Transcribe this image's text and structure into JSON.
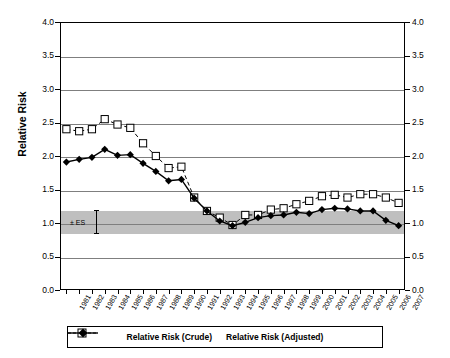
{
  "chart_data": {
    "type": "line",
    "title": "",
    "xlabel": "",
    "ylabel": "Relative Risk",
    "ylim": [
      0.0,
      4.0
    ],
    "ytick_labels": [
      "0.0",
      "0.5",
      "1.0",
      "1.5",
      "2.0",
      "2.5",
      "3.0",
      "3.5",
      "4.0"
    ],
    "ytick_values": [
      0.0,
      0.5,
      1.0,
      1.5,
      2.0,
      2.5,
      3.0,
      3.5,
      4.0
    ],
    "dual_axis": true,
    "right_ytick_labels": [
      "0.0",
      "0.5",
      "1.0",
      "1.5",
      "2.0",
      "2.5",
      "3.0",
      "3.5",
      "4.0"
    ],
    "grid": true,
    "legend_position": "bottom",
    "categories": [
      "1981",
      "1982",
      "1983",
      "1984",
      "1985",
      "1986",
      "1987",
      "1988",
      "1989",
      "1990",
      "1991",
      "1992",
      "1993",
      "1994",
      "1995",
      "1996",
      "1997",
      "1998",
      "1999",
      "2000",
      "2001",
      "2002",
      "2003",
      "2004",
      "2005",
      "2006",
      "2007"
    ],
    "series": [
      {
        "name": "Relative Risk (Crude)",
        "marker": "open-square",
        "line": "dashed",
        "color": "#000000",
        "values": [
          2.4,
          2.37,
          2.4,
          2.55,
          2.47,
          2.42,
          2.19,
          2.0,
          1.82,
          1.84,
          1.38,
          1.18,
          1.08,
          0.97,
          1.12,
          1.12,
          1.2,
          1.22,
          1.28,
          1.33,
          1.4,
          1.42,
          1.38,
          1.43,
          1.43,
          1.38,
          1.3
        ]
      },
      {
        "name": "Relative Risk (Adjusted)",
        "marker": "filled-diamond",
        "line": "solid",
        "color": "#000000",
        "values": [
          1.91,
          1.95,
          1.98,
          2.1,
          2.01,
          2.02,
          1.89,
          1.77,
          1.63,
          1.65,
          1.37,
          1.18,
          1.03,
          0.96,
          1.01,
          1.08,
          1.11,
          1.12,
          1.16,
          1.14,
          1.2,
          1.22,
          1.21,
          1.18,
          1.18,
          1.04,
          0.96
        ]
      }
    ],
    "band": {
      "label": "± ES",
      "lower": 0.85,
      "upper": 1.2,
      "color": "#bfbfbf"
    }
  },
  "legend": {
    "items": [
      {
        "label": "Relative Risk (Crude)"
      },
      {
        "label": "Relative Risk (Adjusted)"
      }
    ]
  },
  "annotation": {
    "es_label": "ES",
    "es_prefix": "±"
  }
}
